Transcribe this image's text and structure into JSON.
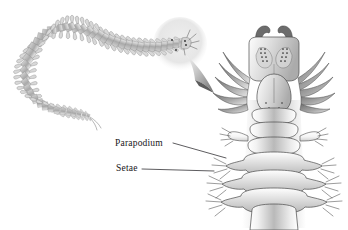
{
  "figure": {
    "kind": "biological-illustration",
    "background_color": "#ffffff",
    "ink_color": "#17161a"
  },
  "labels": [
    {
      "id": "parapodium",
      "text": "Parapodium",
      "leader_from": {
        "x": 173,
        "y": 143
      },
      "leader_to": {
        "x": 226,
        "y": 158
      }
    },
    {
      "id": "setae",
      "text": "Setae",
      "leader_from": {
        "x": 142,
        "y": 169
      },
      "leader_to": {
        "x": 214,
        "y": 171
      }
    }
  ],
  "overview": {
    "name": "whole-worm-overview",
    "description": "Elongate segmented worm curving from lower left up to upper right, with paired lateral parapodia along the entire body and two thin anal cirri at the tail."
  },
  "magnifier": {
    "name": "magnifier-circle",
    "description": "Pale gray circle highlighting the anterior (head) end of the worm",
    "center": {
      "x": 180,
      "y": 44
    },
    "radius": 27,
    "fill_color": "#e9e9e9"
  },
  "callout_arrow": {
    "name": "callout-arrow",
    "description": "Tapering wedge arrow pointing from the magnifier circle down-right to the enlarged anterior detail",
    "from": {
      "x": 185,
      "y": 56
    },
    "to": {
      "x": 217,
      "y": 95
    }
  },
  "detail": {
    "name": "anterior-detail",
    "description": "Enlarged dorsal view of the worm's anterior end showing jaws, prostomium with eyes, tentacular cirri, smooth anterior segments, and posterior segments bearing parapodia with setae",
    "parts": [
      "jaws",
      "peristomium",
      "prostomium",
      "eyes",
      "tentacular-cirri",
      "body-segments",
      "parapodium",
      "setae"
    ]
  },
  "palette": {
    "ink": "#17161a",
    "outline": "#3b3a3e",
    "body_light": "#fbfbfb",
    "body_mid": "#bdbdbd",
    "body_dark": "#8e8e8e",
    "magnifier_fill": "#e9e9e9"
  }
}
